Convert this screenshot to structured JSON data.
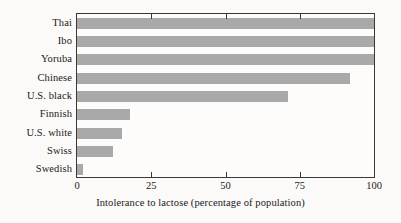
{
  "chart_data": {
    "type": "bar",
    "orientation": "horizontal",
    "title": "",
    "subtitle": "",
    "xlabel": "Intolerance to lactose (percentage of population)",
    "ylabel": "",
    "categories": [
      "Thai",
      "Ibo",
      "Yoruba",
      "Chinese",
      "U.S. black",
      "Finnish",
      "U.S. white",
      "Swiss",
      "Swedish"
    ],
    "values": [
      100,
      100,
      100,
      92,
      71,
      18,
      15,
      12,
      2
    ],
    "xlim": [
      0,
      100
    ],
    "xticks": [
      0,
      25,
      50,
      75,
      100
    ],
    "xticklabels": [
      "0",
      "25",
      "50",
      "75",
      "100"
    ],
    "grid": false,
    "legend": null,
    "bar_color": "#a9a9a9",
    "frame_color": "#3b3836",
    "background_color": "#fbfaf8"
  }
}
